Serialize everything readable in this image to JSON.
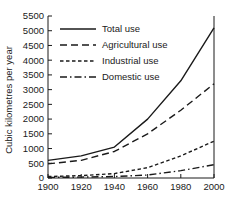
{
  "chart_data": {
    "type": "line",
    "title": "",
    "subtitle": "",
    "xlabel": "",
    "ylabel": "Cubic kilometres per year",
    "x": [
      1900,
      1920,
      1940,
      1960,
      1980,
      2000
    ],
    "xticklabels": [
      "1900",
      "1920",
      "1940",
      "1960",
      "1980",
      "2000"
    ],
    "xlim": [
      1900,
      2000
    ],
    "ylim": [
      0,
      5500
    ],
    "yticks": [
      0,
      500,
      1000,
      1500,
      2000,
      2500,
      3000,
      3500,
      4000,
      4500,
      5000,
      5500
    ],
    "yticklabels": [
      "0",
      "500",
      "1000",
      "1500",
      "2000",
      "2500",
      "3000",
      "3500",
      "4000",
      "4500",
      "5000",
      "5500"
    ],
    "grid": false,
    "legend_position": "upper-left",
    "series": [
      {
        "name": "Total use",
        "linestyle": "solid",
        "dasharray": "",
        "color": "#1a1a1a",
        "values": [
          600,
          750,
          1050,
          2000,
          3300,
          5100
        ]
      },
      {
        "name": "Agricultural use",
        "linestyle": "dashed",
        "dasharray": "7,4",
        "color": "#1a1a1a",
        "values": [
          480,
          600,
          900,
          1500,
          2300,
          3200
        ]
      },
      {
        "name": "Industrial use",
        "linestyle": "fine-dashed",
        "dasharray": "3.5,2.5",
        "color": "#1a1a1a",
        "values": [
          50,
          80,
          150,
          350,
          750,
          1250
        ]
      },
      {
        "name": "Domestic use",
        "linestyle": "dash-dot",
        "dasharray": "7,3,1.5,3",
        "color": "#1a1a1a",
        "values": [
          20,
          30,
          50,
          100,
          250,
          450
        ]
      }
    ]
  },
  "legend": {
    "entries": [
      {
        "label": "Total use",
        "dasharray": ""
      },
      {
        "label": "Agricultural use",
        "dasharray": "7,4"
      },
      {
        "label": "Industrial use",
        "dasharray": "3.5,2.5"
      },
      {
        "label": "Domestic use",
        "dasharray": "7,3,1.5,3"
      }
    ]
  }
}
